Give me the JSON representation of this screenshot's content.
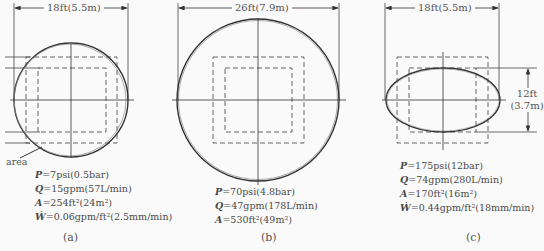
{
  "figure": {
    "panels": [
      {
        "id": "a",
        "caption": "(a)",
        "shape": "circle",
        "width_dimension": "18ft(5.5m)",
        "callout": "area",
        "specs": [
          {
            "var": "P",
            "value": "=7psi(0.5bar)"
          },
          {
            "var": "Q",
            "value": "=15gpm(57L/min)"
          },
          {
            "var": "A",
            "value": "=254ft²(24m²)"
          },
          {
            "var": "Ẇ",
            "value": "=0.06gpm/ft²(2.5mm/min)"
          }
        ]
      },
      {
        "id": "b",
        "caption": "(b)",
        "shape": "circle",
        "width_dimension": "26ft(7.9m)",
        "specs": [
          {
            "var": "P",
            "value": "=70psi(4.8bar)"
          },
          {
            "var": "Q",
            "value": "=47gpm(178L/min)"
          },
          {
            "var": "A",
            "value": "=530ft²(49m²)"
          }
        ]
      },
      {
        "id": "c",
        "caption": "(c)",
        "shape": "ellipse",
        "width_dimension": "18ft(5.5m)",
        "height_dimension": {
          "line1": "12ft",
          "line2": "(3.7m)"
        },
        "specs": [
          {
            "var": "P",
            "value": "=175psi(12bar)"
          },
          {
            "var": "Q",
            "value": "=74gpm(280L/min)"
          },
          {
            "var": "A",
            "value": "=170ft²(16m²)"
          },
          {
            "var": "Ẇ",
            "value": "=0.44gpm/ft²(18mm/min)"
          }
        ]
      }
    ],
    "colors": {
      "line": "#333333",
      "dashed": "#555555",
      "text": "#4a4a4a",
      "background": "#fafafa"
    }
  }
}
